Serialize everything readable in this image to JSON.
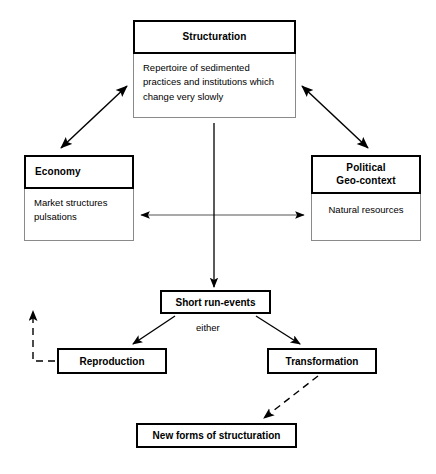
{
  "diagram": {
    "nodes": {
      "structuration": {
        "header": "Structuration",
        "body": "Repertoire of sedimented practices and institutions which change very slowly"
      },
      "economy": {
        "header": "Economy",
        "body": "Market structures pulsations"
      },
      "geocontext": {
        "header": "Political\nGeo-context",
        "header_line1": "Political",
        "header_line2": "Geo-context",
        "body": "Natural resources"
      },
      "short_run_events": {
        "header": "Short run-events"
      },
      "reproduction": {
        "header": "Reproduction"
      },
      "transformation": {
        "header": "Transformation"
      },
      "new_forms": {
        "header": "New forms of structuration"
      }
    },
    "edge_labels": {
      "either": "either"
    },
    "edges": [
      {
        "from": "structuration",
        "to": "economy",
        "style": "solid",
        "arrows": "both"
      },
      {
        "from": "structuration",
        "to": "geocontext",
        "style": "solid",
        "arrows": "both"
      },
      {
        "from": "economy",
        "to": "geocontext",
        "style": "solid",
        "arrows": "both"
      },
      {
        "from": "structuration",
        "to": "short_run_events",
        "style": "solid",
        "arrows": "end"
      },
      {
        "from": "short_run_events",
        "to": "reproduction",
        "style": "solid",
        "arrows": "end",
        "label": "either"
      },
      {
        "from": "short_run_events",
        "to": "transformation",
        "style": "solid",
        "arrows": "end"
      },
      {
        "from": "transformation",
        "to": "new_forms",
        "style": "dashed",
        "arrows": "end"
      },
      {
        "from": "reproduction",
        "to": "structuration",
        "style": "dashed",
        "arrows": "end",
        "note": "feedback loop up the left margin"
      }
    ],
    "caption": "",
    "colors": {
      "background": "#ffffff",
      "stroke": "#000000",
      "body_border": "#8a8a8a",
      "caption": "#d8d8d8"
    }
  }
}
